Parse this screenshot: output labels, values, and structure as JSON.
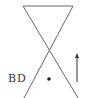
{
  "diagram": {
    "label": "BD",
    "ink_color": "#555555",
    "elements": [
      {
        "type": "cone-outline",
        "description": "inverted triangle top with crossing lines (hourglass)"
      },
      {
        "type": "point",
        "description": "dot"
      },
      {
        "type": "arrow",
        "direction": "up"
      }
    ]
  }
}
